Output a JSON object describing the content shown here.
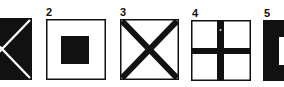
{
  "figure": {
    "panels": [
      {
        "id": 1,
        "label": "",
        "pattern": "white-saltire-on-black",
        "bg": "#111111",
        "fg": "#ffffff"
      },
      {
        "id": 2,
        "label": "2",
        "pattern": "black-square-center-on-white",
        "bg": "#ffffff",
        "fg": "#111111"
      },
      {
        "id": 3,
        "label": "3",
        "pattern": "black-saltire-on-white",
        "bg": "#ffffff",
        "fg": "#111111"
      },
      {
        "id": 4,
        "label": "4",
        "pattern": "black-cross-on-white",
        "bg": "#ffffff",
        "fg": "#111111"
      },
      {
        "id": 5,
        "label": "5",
        "pattern": "white-square-center-on-black",
        "bg": "#111111",
        "fg": "#ffffff"
      }
    ]
  }
}
